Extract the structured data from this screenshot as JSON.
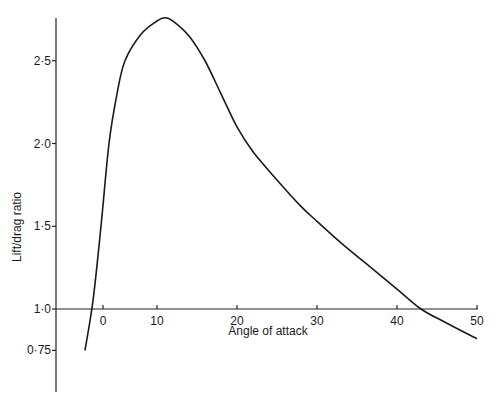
{
  "chart_data": {
    "type": "line",
    "title": "",
    "xlabel": "Angle of attack",
    "ylabel": "Lift/drag ratio",
    "xlim": [
      0,
      50
    ],
    "ylim": [
      0.75,
      2.8
    ],
    "x_ticks": [
      "0",
      "10",
      "20",
      "30",
      "40",
      "50"
    ],
    "y_ticks": [
      "0·75",
      "1·0",
      "1·5",
      "2·0",
      "2·5"
    ],
    "grid": false,
    "legend": null,
    "series": [
      {
        "name": "Lift/drag ratio",
        "x": [
          1,
          2,
          3,
          4,
          5,
          6,
          8,
          10,
          11,
          12,
          14,
          16,
          18,
          20,
          22,
          25,
          28,
          30,
          33,
          36,
          40,
          43,
          46,
          50
        ],
        "y": [
          0.75,
          1.05,
          1.5,
          2.0,
          2.3,
          2.5,
          2.66,
          2.74,
          2.76,
          2.74,
          2.65,
          2.5,
          2.3,
          2.1,
          1.95,
          1.78,
          1.62,
          1.53,
          1.4,
          1.28,
          1.12,
          1.0,
          0.92,
          0.82
        ]
      }
    ]
  },
  "axes": {
    "x_title": "Angle of attack",
    "y_title": "Lift/drag ratio"
  }
}
